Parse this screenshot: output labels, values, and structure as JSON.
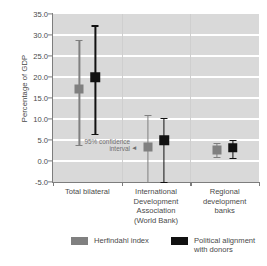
{
  "chart_data": {
    "type": "scatter",
    "title": "",
    "subtitle": "",
    "xlabel": "",
    "ylabel": "Percentage of GDP",
    "ylim": [
      -5.0,
      35.0
    ],
    "ytick_step": 5.0,
    "ytick_labels": [
      "35.0",
      "30.0",
      "25.0",
      "20.0",
      "15.0",
      "10.0",
      "5.0",
      "0.0",
      "-5.0"
    ],
    "ytick_values": [
      35.0,
      30.0,
      25.0,
      20.0,
      15.0,
      10.0,
      5.0,
      0.0,
      -5.0
    ],
    "grid": true,
    "grid_color": "#ffffff",
    "plot_background": "#d9d9d9",
    "legend_position": "bottom",
    "error_bars": "95% confidence interval",
    "categories": [
      "Total bilateral",
      "International Development Association (World Bank)",
      "Regional development banks"
    ],
    "category_labels_wrapped": [
      "Total bilateral",
      "International\nDevelopment\nAssociation\n(World Bank)",
      "Regional\ndevelopment\nbanks"
    ],
    "series": [
      {
        "name": "Herfindahl index",
        "color": "#808080",
        "values": [
          17.1,
          3.3,
          2.6
        ],
        "ci_low": [
          3.8,
          -7.0,
          1.0
        ],
        "ci_high": [
          28.8,
          11.0,
          4.3
        ]
      },
      {
        "name": "Political alignment with donors",
        "color": "#111111",
        "values": [
          20.0,
          5.0,
          3.1
        ],
        "ci_low": [
          6.5,
          -5.5,
          0.8
        ],
        "ci_high": [
          32.3,
          10.3,
          5.0
        ]
      }
    ],
    "annotations": [
      {
        "text": "95% confidence\ninterval",
        "x": 1,
        "y": 4.0
      }
    ]
  },
  "legend": {
    "items": [
      {
        "label": "Herfindahl index",
        "color": "#808080"
      },
      {
        "label": "Political alignment\nwith donors",
        "color": "#111111"
      }
    ]
  },
  "annotation": {
    "text": "95% confidence\ninterval",
    "arrow": "◄"
  }
}
